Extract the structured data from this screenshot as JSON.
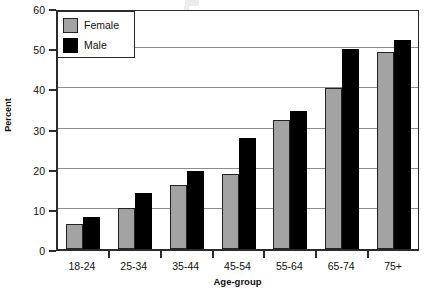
{
  "chart_data": {
    "type": "bar",
    "title": "",
    "xlabel": "Age-group",
    "ylabel": "Percent",
    "categories": [
      "18-24",
      "25-34",
      "35-44",
      "45-54",
      "55-64",
      "65-74",
      "75+"
    ],
    "series": [
      {
        "name": "Female",
        "color": "#a3a3a3",
        "values": [
          6.3,
          10.2,
          16.0,
          18.7,
          32.0,
          40.0,
          49.0
        ]
      },
      {
        "name": "Male",
        "color": "#000000",
        "values": [
          8.0,
          14.0,
          19.3,
          27.7,
          34.3,
          49.8,
          52.0
        ]
      }
    ],
    "ylim": [
      0,
      60
    ],
    "yticks": [
      0,
      10,
      20,
      30,
      40,
      50,
      60
    ],
    "ytick_labels": [
      "0",
      "10",
      "20",
      "30",
      "40",
      "50",
      "60"
    ],
    "grid": "horizontal",
    "legend_position": "top-left"
  },
  "legend": {
    "entries": [
      {
        "label": "Female"
      },
      {
        "label": "Male"
      }
    ]
  }
}
